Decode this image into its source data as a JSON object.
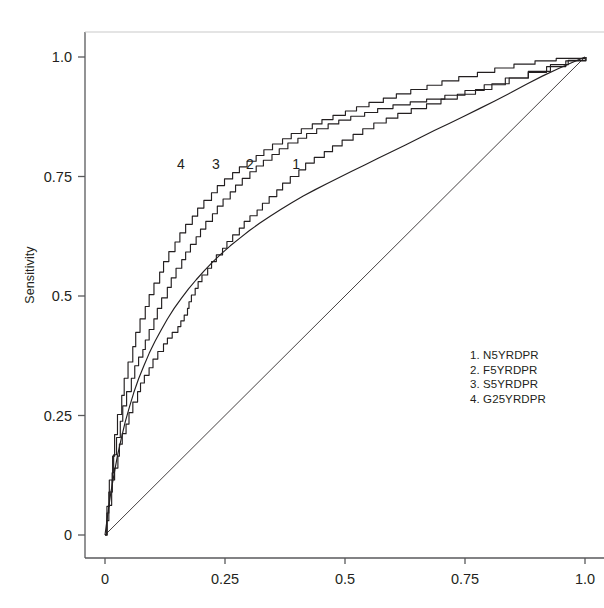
{
  "chart_data": {
    "type": "line",
    "title": "",
    "xlabel": "",
    "ylabel": "Sensitivity",
    "xlim": [
      0,
      1
    ],
    "ylim": [
      0,
      1
    ],
    "grid": false,
    "legend_position": "inside-lower-right",
    "xticks": [
      "0",
      "0.25",
      "0.5",
      "0.75",
      "1.0"
    ],
    "xtick_values": [
      0,
      0.25,
      0.5,
      0.75,
      1.0
    ],
    "yticks": [
      "0",
      "0.25",
      "0.5",
      "0.75",
      "1.0"
    ],
    "ytick_values": [
      0,
      0.25,
      0.5,
      0.75,
      1.0
    ],
    "reference_line": {
      "name": "chance-diagonal",
      "from": [
        0,
        0
      ],
      "to": [
        1,
        1
      ]
    },
    "series": [
      {
        "name": "N5YRDPR",
        "tag": "1",
        "tag_x": 0.398,
        "tag_y": 0.776,
        "style": "step",
        "points": [
          [
            0.0,
            0.0
          ],
          [
            0.004,
            0.03
          ],
          [
            0.008,
            0.062
          ],
          [
            0.012,
            0.09
          ],
          [
            0.015,
            0.115
          ],
          [
            0.02,
            0.14
          ],
          [
            0.025,
            0.165
          ],
          [
            0.03,
            0.19
          ],
          [
            0.036,
            0.212
          ],
          [
            0.042,
            0.232
          ],
          [
            0.05,
            0.256
          ],
          [
            0.058,
            0.278
          ],
          [
            0.066,
            0.3
          ],
          [
            0.074,
            0.318
          ],
          [
            0.082,
            0.334
          ],
          [
            0.09,
            0.35
          ],
          [
            0.1,
            0.368
          ],
          [
            0.11,
            0.384
          ],
          [
            0.12,
            0.4
          ],
          [
            0.13,
            0.412
          ],
          [
            0.14,
            0.424
          ],
          [
            0.15,
            0.436
          ],
          [
            0.158,
            0.448
          ],
          [
            0.165,
            0.46
          ],
          [
            0.17,
            0.474
          ],
          [
            0.175,
            0.488
          ],
          [
            0.18,
            0.502
          ],
          [
            0.186,
            0.516
          ],
          [
            0.194,
            0.53
          ],
          [
            0.202,
            0.544
          ],
          [
            0.212,
            0.558
          ],
          [
            0.222,
            0.572
          ],
          [
            0.232,
            0.586
          ],
          [
            0.243,
            0.6
          ],
          [
            0.254,
            0.614
          ],
          [
            0.266,
            0.628
          ],
          [
            0.278,
            0.642
          ],
          [
            0.29,
            0.656
          ],
          [
            0.302,
            0.668
          ],
          [
            0.315,
            0.68
          ],
          [
            0.328,
            0.694
          ],
          [
            0.342,
            0.708
          ],
          [
            0.356,
            0.722
          ],
          [
            0.37,
            0.736
          ],
          [
            0.386,
            0.75
          ],
          [
            0.402,
            0.764
          ],
          [
            0.418,
            0.778
          ],
          [
            0.436,
            0.79
          ],
          [
            0.455,
            0.802
          ],
          [
            0.474,
            0.814
          ],
          [
            0.494,
            0.826
          ],
          [
            0.515,
            0.838
          ],
          [
            0.537,
            0.85
          ],
          [
            0.56,
            0.862
          ],
          [
            0.584,
            0.872
          ],
          [
            0.61,
            0.882
          ],
          [
            0.638,
            0.892
          ],
          [
            0.668,
            0.902
          ],
          [
            0.7,
            0.912
          ],
          [
            0.734,
            0.922
          ],
          [
            0.77,
            0.932
          ],
          [
            0.806,
            0.944
          ],
          [
            0.842,
            0.956
          ],
          [
            0.88,
            0.968
          ],
          [
            0.92,
            0.98
          ],
          [
            0.96,
            0.992
          ],
          [
            1.0,
            1.0
          ]
        ]
      },
      {
        "name": "F5YRDPR",
        "tag": "2",
        "tag_x": 0.302,
        "tag_y": 0.776,
        "style": "smooth",
        "points": [
          [
            0.0,
            0.0
          ],
          [
            0.006,
            0.045
          ],
          [
            0.012,
            0.088
          ],
          [
            0.019,
            0.128
          ],
          [
            0.026,
            0.166
          ],
          [
            0.034,
            0.202
          ],
          [
            0.042,
            0.236
          ],
          [
            0.051,
            0.268
          ],
          [
            0.06,
            0.298
          ],
          [
            0.07,
            0.327
          ],
          [
            0.081,
            0.354
          ],
          [
            0.092,
            0.38
          ],
          [
            0.104,
            0.405
          ],
          [
            0.117,
            0.429
          ],
          [
            0.13,
            0.452
          ],
          [
            0.144,
            0.474
          ],
          [
            0.159,
            0.495
          ],
          [
            0.174,
            0.515
          ],
          [
            0.19,
            0.534
          ],
          [
            0.207,
            0.553
          ],
          [
            0.224,
            0.571
          ],
          [
            0.242,
            0.588
          ],
          [
            0.261,
            0.605
          ],
          [
            0.281,
            0.621
          ],
          [
            0.301,
            0.637
          ],
          [
            0.322,
            0.652
          ],
          [
            0.344,
            0.667
          ],
          [
            0.366,
            0.681
          ],
          [
            0.389,
            0.695
          ],
          [
            0.413,
            0.709
          ],
          [
            0.437,
            0.722
          ],
          [
            0.462,
            0.735
          ],
          [
            0.488,
            0.748
          ],
          [
            0.514,
            0.761
          ],
          [
            0.541,
            0.774
          ],
          [
            0.569,
            0.788
          ],
          [
            0.597,
            0.802
          ],
          [
            0.626,
            0.816
          ],
          [
            0.656,
            0.831
          ],
          [
            0.686,
            0.846
          ],
          [
            0.717,
            0.861
          ],
          [
            0.748,
            0.876
          ],
          [
            0.78,
            0.892
          ],
          [
            0.812,
            0.908
          ],
          [
            0.845,
            0.925
          ],
          [
            0.878,
            0.943
          ],
          [
            0.911,
            0.96
          ],
          [
            0.945,
            0.976
          ],
          [
            0.972,
            0.988
          ],
          [
            1.0,
            1.0
          ]
        ]
      },
      {
        "name": "S5YRDPR",
        "tag": "3",
        "tag_x": 0.231,
        "tag_y": 0.776,
        "style": "step",
        "points": [
          [
            0.0,
            0.0
          ],
          [
            0.004,
            0.046
          ],
          [
            0.008,
            0.09
          ],
          [
            0.013,
            0.13
          ],
          [
            0.018,
            0.168
          ],
          [
            0.024,
            0.204
          ],
          [
            0.03,
            0.238
          ],
          [
            0.037,
            0.27
          ],
          [
            0.045,
            0.3
          ],
          [
            0.053,
            0.328
          ],
          [
            0.062,
            0.354
          ],
          [
            0.07,
            0.372
          ],
          [
            0.077,
            0.388
          ],
          [
            0.084,
            0.408
          ],
          [
            0.092,
            0.43
          ],
          [
            0.1,
            0.452
          ],
          [
            0.109,
            0.474
          ],
          [
            0.118,
            0.496
          ],
          [
            0.128,
            0.518
          ],
          [
            0.138,
            0.538
          ],
          [
            0.148,
            0.558
          ],
          [
            0.158,
            0.576
          ],
          [
            0.168,
            0.592
          ],
          [
            0.178,
            0.608
          ],
          [
            0.188,
            0.624
          ],
          [
            0.199,
            0.64
          ],
          [
            0.21,
            0.656
          ],
          [
            0.222,
            0.672
          ],
          [
            0.234,
            0.688
          ],
          [
            0.246,
            0.703
          ],
          [
            0.259,
            0.718
          ],
          [
            0.272,
            0.732
          ],
          [
            0.286,
            0.746
          ],
          [
            0.3,
            0.76
          ],
          [
            0.315,
            0.772
          ],
          [
            0.33,
            0.784
          ],
          [
            0.346,
            0.796
          ],
          [
            0.363,
            0.808
          ],
          [
            0.381,
            0.82
          ],
          [
            0.4,
            0.83
          ],
          [
            0.42,
            0.84
          ],
          [
            0.441,
            0.85
          ],
          [
            0.463,
            0.86
          ],
          [
            0.487,
            0.868
          ],
          [
            0.512,
            0.876
          ],
          [
            0.539,
            0.884
          ],
          [
            0.568,
            0.892
          ],
          [
            0.6,
            0.9
          ],
          [
            0.634,
            0.906
          ],
          [
            0.67,
            0.912
          ],
          [
            0.708,
            0.92
          ],
          [
            0.748,
            0.93
          ],
          [
            0.79,
            0.942
          ],
          [
            0.834,
            0.956
          ],
          [
            0.88,
            0.97
          ],
          [
            0.928,
            0.984
          ],
          [
            0.965,
            0.993
          ],
          [
            1.0,
            1.0
          ]
        ]
      },
      {
        "name": "G25YRDPR",
        "tag": "4",
        "tag_x": 0.158,
        "tag_y": 0.776,
        "style": "step",
        "points": [
          [
            0.0,
            0.0
          ],
          [
            0.004,
            0.06
          ],
          [
            0.009,
            0.115
          ],
          [
            0.014,
            0.165
          ],
          [
            0.02,
            0.21
          ],
          [
            0.026,
            0.252
          ],
          [
            0.033,
            0.292
          ],
          [
            0.04,
            0.328
          ],
          [
            0.048,
            0.362
          ],
          [
            0.056,
            0.394
          ],
          [
            0.064,
            0.424
          ],
          [
            0.073,
            0.452
          ],
          [
            0.082,
            0.478
          ],
          [
            0.092,
            0.503
          ],
          [
            0.102,
            0.527
          ],
          [
            0.112,
            0.55
          ],
          [
            0.122,
            0.572
          ],
          [
            0.133,
            0.593
          ],
          [
            0.144,
            0.613
          ],
          [
            0.156,
            0.632
          ],
          [
            0.168,
            0.65
          ],
          [
            0.18,
            0.667
          ],
          [
            0.193,
            0.684
          ],
          [
            0.206,
            0.7
          ],
          [
            0.22,
            0.716
          ],
          [
            0.234,
            0.731
          ],
          [
            0.249,
            0.745
          ],
          [
            0.264,
            0.758
          ],
          [
            0.28,
            0.77
          ],
          [
            0.296,
            0.782
          ],
          [
            0.313,
            0.794
          ],
          [
            0.331,
            0.806
          ],
          [
            0.349,
            0.818
          ],
          [
            0.368,
            0.829
          ],
          [
            0.388,
            0.84
          ],
          [
            0.409,
            0.85
          ],
          [
            0.43,
            0.86
          ],
          [
            0.452,
            0.869
          ],
          [
            0.475,
            0.878
          ],
          [
            0.499,
            0.887
          ],
          [
            0.524,
            0.896
          ],
          [
            0.55,
            0.905
          ],
          [
            0.578,
            0.914
          ],
          [
            0.607,
            0.923
          ],
          [
            0.637,
            0.932
          ],
          [
            0.669,
            0.941
          ],
          [
            0.702,
            0.95
          ],
          [
            0.737,
            0.959
          ],
          [
            0.774,
            0.968
          ],
          [
            0.812,
            0.977
          ],
          [
            0.852,
            0.985
          ],
          [
            0.894,
            0.992
          ],
          [
            0.94,
            0.997
          ],
          [
            1.0,
            1.0
          ]
        ]
      }
    ]
  },
  "legend": {
    "entries": [
      "1. N5YRDPR",
      "2. F5YRDPR",
      "3. S5YRDPR",
      "4. G25YRDPR"
    ]
  },
  "axes": {
    "y_title": "Sensitivity"
  },
  "colors": {
    "curve": "#231f20",
    "axis": "#58595b",
    "background": "#ffffff"
  }
}
